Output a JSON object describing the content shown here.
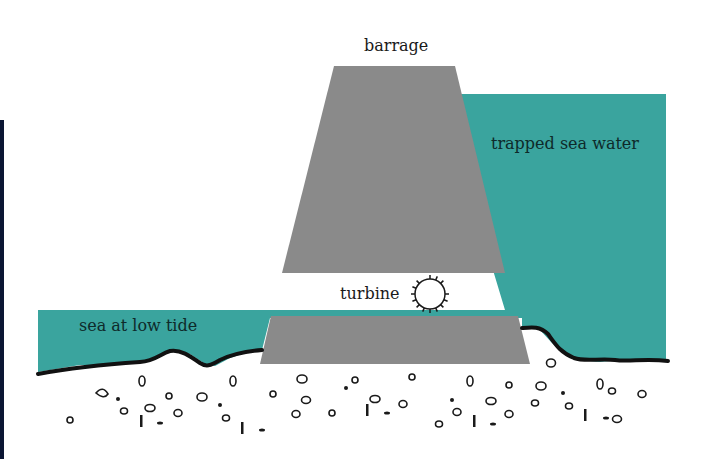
{
  "diagram": {
    "colors": {
      "water": "#3aa49e",
      "concrete": "#8a8a8a",
      "ground_line": "#111111",
      "left_bar": "#0b1633"
    },
    "labels": {
      "barrage": "barrage",
      "trapped_water": "trapped sea water",
      "turbine": "turbine",
      "sea_low_tide": "sea at low tide"
    }
  }
}
